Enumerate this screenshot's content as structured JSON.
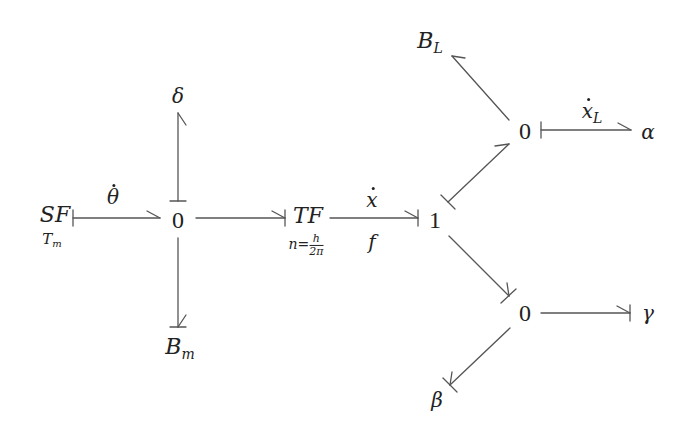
{
  "diagram": {
    "type": "bond-graph",
    "colors": {
      "line": "#555555",
      "text": "#222222",
      "background": "#ffffff"
    },
    "nodes": {
      "source_flow": {
        "label": "SF",
        "param": "T",
        "param_sub": "m"
      },
      "junction0_left": {
        "label": "0"
      },
      "delta": {
        "label": "δ"
      },
      "damper_m": {
        "label": "B",
        "sub": "m"
      },
      "transformer": {
        "label": "TF",
        "param_lhs": "n=",
        "param_num": "h",
        "param_den": "2π"
      },
      "junction1": {
        "label": "1"
      },
      "junction0_upper": {
        "label": "0"
      },
      "damper_L": {
        "label": "B",
        "sub": "L"
      },
      "alpha": {
        "label": "α"
      },
      "junction0_lower": {
        "label": "0"
      },
      "gamma": {
        "label": "γ"
      },
      "beta": {
        "label": "β"
      }
    },
    "bond_labels": {
      "theta_dot": "θ",
      "x_dot": "x",
      "f": "f",
      "xL_dot": "x",
      "xL_sub": "L"
    },
    "bonds": [
      {
        "from": "SF",
        "to": "0 (left)",
        "label_above": "θ̇",
        "causal_stroke": "SF end"
      },
      {
        "from": "0 (left)",
        "to": "δ",
        "causal_stroke": "0 end"
      },
      {
        "from": "0 (left)",
        "to": "B_m",
        "causal_stroke": "B_m end"
      },
      {
        "from": "0 (left)",
        "to": "TF",
        "causal_stroke": "TF end"
      },
      {
        "from": "TF",
        "to": "1",
        "label_above": "ẋ",
        "label_below": "f",
        "causal_stroke": "1 end"
      },
      {
        "from": "1",
        "to": "0 (upper)",
        "causal_stroke": "1 end"
      },
      {
        "from": "0 (upper)",
        "to": "B_L",
        "causal_stroke": "none"
      },
      {
        "from": "0 (upper)",
        "to": "α",
        "label_above": "ẋ_L",
        "causal_stroke": "0 end"
      },
      {
        "from": "1",
        "to": "0 (lower)",
        "causal_stroke": "0 end"
      },
      {
        "from": "0 (lower)",
        "to": "γ",
        "causal_stroke": "γ end"
      },
      {
        "from": "0 (lower)",
        "to": "β",
        "causal_stroke": "β end"
      }
    ]
  }
}
